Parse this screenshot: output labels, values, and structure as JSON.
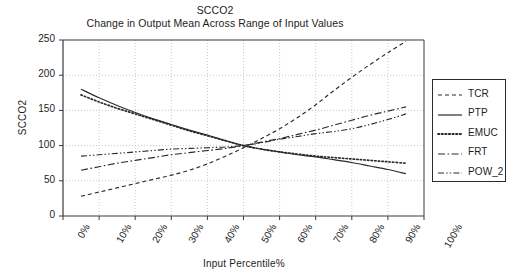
{
  "chart_data": {
    "type": "line",
    "title": "SCCO2",
    "subtitle": "Change in Output Mean Across Range of Input Values",
    "xlabel": "Input Percentile%",
    "ylabel": "SCCO2",
    "xlim": [
      0,
      100
    ],
    "ylim": [
      0,
      250
    ],
    "grid": true,
    "legend_position": "right-outside",
    "x_ticks": [
      "0%",
      "10%",
      "20%",
      "30%",
      "40%",
      "50%",
      "60%",
      "70%",
      "80%",
      "90%",
      "100%"
    ],
    "y_ticks": [
      "0",
      "50",
      "100",
      "150",
      "200",
      "250"
    ],
    "x": [
      5,
      10,
      15,
      20,
      25,
      30,
      35,
      40,
      45,
      50,
      55,
      60,
      65,
      70,
      75,
      80,
      85,
      90,
      95
    ],
    "series": [
      {
        "name": "TCR",
        "style": "dashed",
        "values": [
          28,
          34,
          40,
          46,
          52,
          58,
          65,
          74,
          85,
          97,
          110,
          124,
          140,
          158,
          178,
          197,
          215,
          232,
          248
        ]
      },
      {
        "name": "PTP",
        "style": "solid",
        "values": [
          180,
          168,
          157,
          147,
          138,
          130,
          122,
          115,
          107,
          100,
          95,
          91,
          87,
          84,
          80,
          76,
          71,
          66,
          60
        ]
      },
      {
        "name": "EMUC",
        "style": "dotted",
        "values": [
          172,
          162,
          153,
          145,
          137,
          129,
          121,
          114,
          107,
          100,
          95,
          91,
          88,
          85,
          83,
          81,
          79,
          77,
          75
        ]
      },
      {
        "name": "FRT",
        "style": "dashdot",
        "values": [
          65,
          70,
          75,
          79,
          83,
          87,
          90,
          93,
          96,
          100,
          105,
          110,
          116,
          122,
          129,
          136,
          143,
          149,
          155
        ]
      },
      {
        "name": "POW_2",
        "style": "dashdotdot",
        "values": [
          85,
          87,
          89,
          91,
          93,
          95,
          96,
          97,
          98,
          100,
          104,
          109,
          113,
          117,
          120,
          124,
          130,
          137,
          145
        ]
      }
    ]
  },
  "legend": {
    "items": [
      {
        "label": "TCR"
      },
      {
        "label": "PTP"
      },
      {
        "label": "EMUC"
      },
      {
        "label": "FRT"
      },
      {
        "label": "POW_2"
      }
    ]
  },
  "colors": {
    "line": "#2b2b2b",
    "grid": "#c9c9c9",
    "axis": "#3a3a3a",
    "text": "#1d1d1d",
    "background": "#ffffff"
  }
}
